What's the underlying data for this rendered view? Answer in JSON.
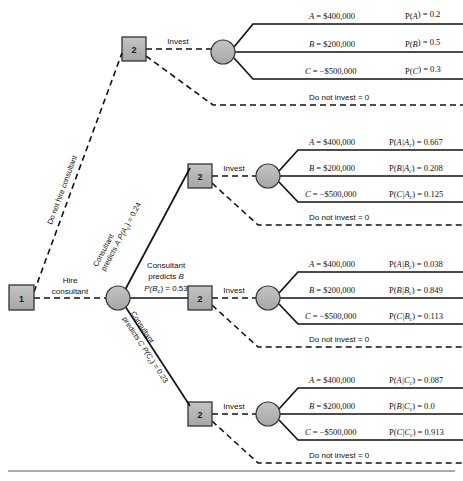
{
  "diagram": {
    "type": "decision-tree",
    "canvas": {
      "width": 463,
      "height": 481
    },
    "colors": {
      "node_fill": "#b3b3b3",
      "node_stroke": "#333333",
      "line": "#111111",
      "background": "#ffffff",
      "rule": "#8c8c8c"
    }
  },
  "nodes": {
    "root_decision": {
      "label": "1",
      "shape": "square"
    },
    "chance_consultant": {
      "label": "",
      "shape": "circle"
    },
    "decision_no_consultant": {
      "label": "2",
      "shape": "square"
    },
    "decision_predicts_a": {
      "label": "2",
      "shape": "square"
    },
    "decision_predicts_b": {
      "label": "2",
      "shape": "square"
    },
    "decision_predicts_c": {
      "label": "2",
      "shape": "square"
    }
  },
  "root_branches": {
    "do_not_hire": "Do not hire consultant",
    "hire_line1": "Hire",
    "hire_line2": "consultant"
  },
  "consultant_branches": [
    {
      "id": "predicts-a",
      "line1": "Consultant",
      "line2_prefix": "predicts ",
      "line2_var": "A",
      "prob_label": "P(A",
      "prob_sub": "c",
      "prob_tail": ") = 0.24",
      "prob_value": 0.24
    },
    {
      "id": "predicts-b",
      "line1": "Consultant",
      "line2_prefix": "predicts ",
      "line2_var": "B",
      "prob_label": "P(B",
      "prob_sub": "c",
      "prob_tail": ") = 0.53",
      "prob_value": 0.53
    },
    {
      "id": "predicts-c",
      "line1": "Consultant",
      "line2_prefix": "predicts ",
      "line2_var": "C",
      "prob_label": "P(C",
      "prob_sub": "c",
      "prob_tail": ") = 0.23",
      "prob_value": 0.23
    }
  ],
  "invest_label": "Invest",
  "do_not_invest_label": "Do not invest = 0",
  "sections": [
    {
      "id": "no-consultant",
      "outcomes": [
        {
          "var": "A",
          "payoff": " = $400,000",
          "prob_head": "P(",
          "prob_var": "A",
          "prob_sub": "",
          "prob_tail": ") = 0.2",
          "prob_value": 0.2,
          "payoff_value": 400000
        },
        {
          "var": "B",
          "payoff": " = $200,000",
          "prob_head": "P(",
          "prob_var": "B",
          "prob_sub": "",
          "prob_tail": ") = 0.5",
          "prob_value": 0.5,
          "payoff_value": 200000
        },
        {
          "var": "C",
          "payoff": " = −$500,000",
          "prob_head": "P(",
          "prob_var": "C",
          "prob_sub": "",
          "prob_tail": ") = 0.3",
          "prob_value": 0.3,
          "payoff_value": -500000
        }
      ]
    },
    {
      "id": "predicts-a",
      "outcomes": [
        {
          "var": "A",
          "payoff": " = $400,000",
          "prob_head": "P(",
          "prob_var": "A|A",
          "prob_sub": "c",
          "prob_tail": ") = 0.667",
          "prob_value": 0.667,
          "payoff_value": 400000
        },
        {
          "var": "B",
          "payoff": " = $200,000",
          "prob_head": "P(",
          "prob_var": "B|A",
          "prob_sub": "c",
          "prob_tail": ") = 0.208",
          "prob_value": 0.208,
          "payoff_value": 200000
        },
        {
          "var": "C",
          "payoff": " = −$500,000",
          "prob_head": "P(",
          "prob_var": "C|A",
          "prob_sub": "c",
          "prob_tail": ") = 0.125",
          "prob_value": 0.125,
          "payoff_value": -500000
        }
      ]
    },
    {
      "id": "predicts-b",
      "outcomes": [
        {
          "var": "A",
          "payoff": " = $400,000",
          "prob_head": "P(",
          "prob_var": "A|B",
          "prob_sub": "c",
          "prob_tail": ") = 0.038",
          "prob_value": 0.038,
          "payoff_value": 400000
        },
        {
          "var": "B",
          "payoff": " = $200,000",
          "prob_head": "P(",
          "prob_var": "B|B",
          "prob_sub": "c",
          "prob_tail": ") = 0.849",
          "prob_value": 0.849,
          "payoff_value": 200000
        },
        {
          "var": "C",
          "payoff": " = −$500,000",
          "prob_head": "P(",
          "prob_var": "C|B",
          "prob_sub": "c",
          "prob_tail": ") = 0.113",
          "prob_value": 0.113,
          "payoff_value": -500000
        }
      ]
    },
    {
      "id": "predicts-c",
      "outcomes": [
        {
          "var": "A",
          "payoff": " = $400,000",
          "prob_head": "P(",
          "prob_var": "A|C",
          "prob_sub": "c",
          "prob_tail": ") = 0.087",
          "prob_value": 0.087,
          "payoff_value": 400000
        },
        {
          "var": "B",
          "payoff": " = $200,000",
          "prob_head": "P(",
          "prob_var": "B|C",
          "prob_sub": "c",
          "prob_tail": ") = 0.0",
          "prob_value": 0.0,
          "payoff_value": 200000
        },
        {
          "var": "C",
          "payoff": " = −$500,000",
          "prob_head": "P(",
          "prob_var": "C|C",
          "prob_sub": "c",
          "prob_tail": ") = 0.913",
          "prob_value": 0.913,
          "payoff_value": -500000
        }
      ]
    }
  ]
}
